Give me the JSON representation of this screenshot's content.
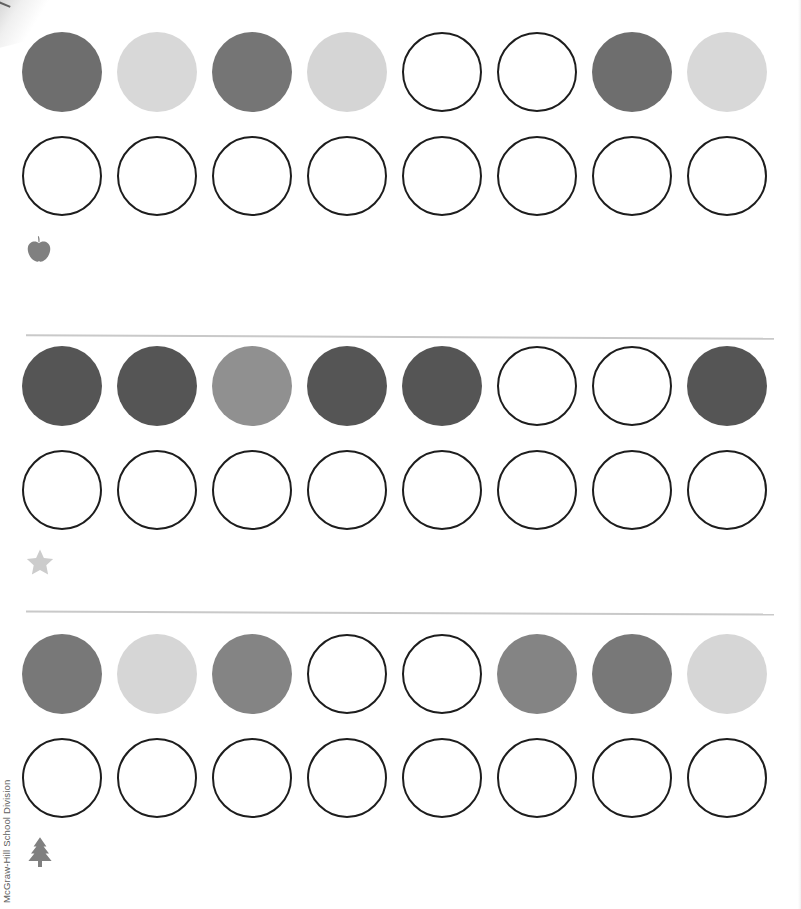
{
  "document": {
    "type": "worksheet",
    "watermark": "McGraw-Hill School Division",
    "page_width": 801,
    "page_height": 909
  },
  "palette": {
    "ink": "#1d1d1d",
    "separator": "#c9c9c9",
    "empty_fill": "#ffffff",
    "gray_dark": "#555555",
    "gray_mediumdark": "#6e6e6e",
    "gray_medium": "#787878",
    "gray_light_medium": "#909090",
    "gray_light": "#d6d6d6",
    "icon_gray": "#808080",
    "icon_light_gray": "#cccccc"
  },
  "geometry": {
    "circle_diameter": 80,
    "circle_spacing": 95,
    "empty_border_width": 2.2
  },
  "exercises": [
    {
      "id": "exercise-1",
      "icon": "apple-icon",
      "icon_color": "#808080",
      "pattern_row": {
        "label": "pattern-row",
        "circles": [
          {
            "state": "filled",
            "color": "#6e6e6e"
          },
          {
            "state": "filled",
            "color": "#d8d8d8"
          },
          {
            "state": "filled",
            "color": "#757575"
          },
          {
            "state": "filled",
            "color": "#d5d5d5"
          },
          {
            "state": "empty",
            "color": "#ffffff"
          },
          {
            "state": "empty",
            "color": "#ffffff"
          },
          {
            "state": "filled",
            "color": "#6e6e6e"
          },
          {
            "state": "filled",
            "color": "#d8d8d8"
          }
        ]
      },
      "answer_row": {
        "label": "answer-row",
        "circles": [
          {
            "state": "empty",
            "color": "#ffffff"
          },
          {
            "state": "empty",
            "color": "#ffffff"
          },
          {
            "state": "empty",
            "color": "#ffffff"
          },
          {
            "state": "empty",
            "color": "#ffffff"
          },
          {
            "state": "empty",
            "color": "#ffffff"
          },
          {
            "state": "empty",
            "color": "#ffffff"
          },
          {
            "state": "empty",
            "color": "#ffffff"
          },
          {
            "state": "empty",
            "color": "#ffffff"
          }
        ]
      }
    },
    {
      "id": "exercise-2",
      "icon": "star-icon",
      "icon_color": "#cccccc",
      "pattern_row": {
        "label": "pattern-row",
        "circles": [
          {
            "state": "filled",
            "color": "#555555"
          },
          {
            "state": "filled",
            "color": "#555555"
          },
          {
            "state": "filled",
            "color": "#909090"
          },
          {
            "state": "filled",
            "color": "#555555"
          },
          {
            "state": "filled",
            "color": "#555555"
          },
          {
            "state": "empty",
            "color": "#ffffff"
          },
          {
            "state": "empty",
            "color": "#ffffff"
          },
          {
            "state": "filled",
            "color": "#555555"
          }
        ]
      },
      "answer_row": {
        "label": "answer-row",
        "circles": [
          {
            "state": "empty",
            "color": "#ffffff"
          },
          {
            "state": "empty",
            "color": "#ffffff"
          },
          {
            "state": "empty",
            "color": "#ffffff"
          },
          {
            "state": "empty",
            "color": "#ffffff"
          },
          {
            "state": "empty",
            "color": "#ffffff"
          },
          {
            "state": "empty",
            "color": "#ffffff"
          },
          {
            "state": "empty",
            "color": "#ffffff"
          },
          {
            "state": "empty",
            "color": "#ffffff"
          }
        ]
      }
    },
    {
      "id": "exercise-3",
      "icon": "tree-icon",
      "icon_color": "#808080",
      "pattern_row": {
        "label": "pattern-row",
        "circles": [
          {
            "state": "filled",
            "color": "#787878"
          },
          {
            "state": "filled",
            "color": "#d6d6d6"
          },
          {
            "state": "filled",
            "color": "#848484"
          },
          {
            "state": "empty",
            "color": "#ffffff"
          },
          {
            "state": "empty",
            "color": "#ffffff"
          },
          {
            "state": "filled",
            "color": "#848484"
          },
          {
            "state": "filled",
            "color": "#787878"
          },
          {
            "state": "filled",
            "color": "#d6d6d6"
          }
        ]
      },
      "answer_row": {
        "label": "answer-row",
        "circles": [
          {
            "state": "empty",
            "color": "#ffffff"
          },
          {
            "state": "empty",
            "color": "#ffffff"
          },
          {
            "state": "empty",
            "color": "#ffffff"
          },
          {
            "state": "empty",
            "color": "#ffffff"
          },
          {
            "state": "empty",
            "color": "#ffffff"
          },
          {
            "state": "empty",
            "color": "#ffffff"
          },
          {
            "state": "empty",
            "color": "#ffffff"
          },
          {
            "state": "empty",
            "color": "#ffffff"
          }
        ]
      }
    }
  ],
  "separators": [
    {
      "name": "separator-1"
    },
    {
      "name": "separator-2"
    }
  ]
}
